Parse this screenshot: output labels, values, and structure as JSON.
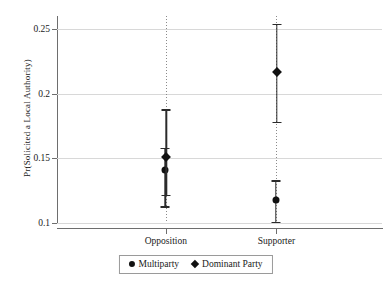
{
  "chart_data": {
    "type": "scatter",
    "title": "",
    "xlabel": "",
    "ylabel": "Pr(Solicited a Local Authority)",
    "categories": [
      "Opposition",
      "Supporter"
    ],
    "ylim": [
      0.1,
      0.26
    ],
    "yticks": [
      0.1,
      0.15,
      0.2,
      0.25
    ],
    "ytick_labels": [
      "0.1",
      "0.15",
      "0.2",
      "0.25"
    ],
    "grid": "horizontal",
    "legend_position": "bottom-center",
    "error_bars": "confidence-interval",
    "series": [
      {
        "name": "Multiparty",
        "marker": "circle",
        "values": [
          0.141,
          0.118
        ],
        "ci_low": [
          0.113,
          0.101
        ],
        "ci_high": [
          0.158,
          0.133
        ]
      },
      {
        "name": "Dominant Party",
        "marker": "diamond",
        "values": [
          0.151,
          0.217
        ],
        "ci_low": [
          0.122,
          0.178
        ],
        "ci_high": [
          0.188,
          0.254
        ]
      }
    ]
  },
  "legend": {
    "entries": [
      {
        "label": "Multiparty",
        "symbol": "circle-marker"
      },
      {
        "label": "Dominant Party",
        "symbol": "diamond-marker"
      }
    ]
  }
}
